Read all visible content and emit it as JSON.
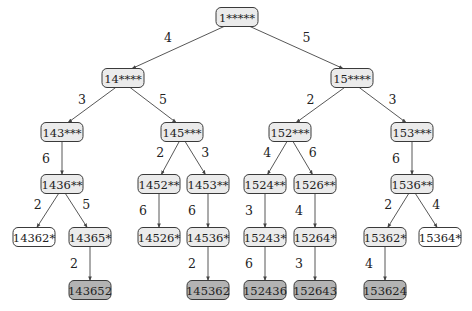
{
  "colors": {
    "internal_fill": "#ebebeb",
    "leaf_dead_fill": "#ffffff",
    "solution_fill": "#b3b3b3",
    "stroke": "#3a3a3a"
  },
  "nodes": [
    {
      "id": "n1",
      "label": "1*****",
      "kind": "internal"
    },
    {
      "id": "n14",
      "label": "14****",
      "kind": "internal"
    },
    {
      "id": "n15",
      "label": "15****",
      "kind": "internal"
    },
    {
      "id": "n143",
      "label": "143***",
      "kind": "internal"
    },
    {
      "id": "n145",
      "label": "145***",
      "kind": "internal"
    },
    {
      "id": "n152",
      "label": "152***",
      "kind": "internal"
    },
    {
      "id": "n153",
      "label": "153***",
      "kind": "internal"
    },
    {
      "id": "n1436",
      "label": "1436**",
      "kind": "internal"
    },
    {
      "id": "n1452",
      "label": "1452**",
      "kind": "internal"
    },
    {
      "id": "n1453",
      "label": "1453**",
      "kind": "internal"
    },
    {
      "id": "n1524",
      "label": "1524**",
      "kind": "internal"
    },
    {
      "id": "n1526",
      "label": "1526**",
      "kind": "internal"
    },
    {
      "id": "n1536",
      "label": "1536**",
      "kind": "internal"
    },
    {
      "id": "n14362",
      "label": "14362*",
      "kind": "dead"
    },
    {
      "id": "n14365",
      "label": "14365*",
      "kind": "internal"
    },
    {
      "id": "n14526",
      "label": "14526*",
      "kind": "internal"
    },
    {
      "id": "n14536",
      "label": "14536*",
      "kind": "internal"
    },
    {
      "id": "n15243",
      "label": "15243*",
      "kind": "internal"
    },
    {
      "id": "n15264",
      "label": "15264*",
      "kind": "internal"
    },
    {
      "id": "n15362",
      "label": "15362*",
      "kind": "internal"
    },
    {
      "id": "n15364",
      "label": "15364*",
      "kind": "dead"
    },
    {
      "id": "n143652",
      "label": "143652",
      "kind": "solution"
    },
    {
      "id": "n145362",
      "label": "145362",
      "kind": "solution"
    },
    {
      "id": "n152436",
      "label": "152436",
      "kind": "solution"
    },
    {
      "id": "n152643",
      "label": "152643",
      "kind": "solution"
    },
    {
      "id": "n153624",
      "label": "153624",
      "kind": "solution"
    }
  ],
  "edges": [
    {
      "from": "n1",
      "to": "n14",
      "label": "4"
    },
    {
      "from": "n1",
      "to": "n15",
      "label": "5"
    },
    {
      "from": "n14",
      "to": "n143",
      "label": "3"
    },
    {
      "from": "n14",
      "to": "n145",
      "label": "5"
    },
    {
      "from": "n15",
      "to": "n152",
      "label": "2"
    },
    {
      "from": "n15",
      "to": "n153",
      "label": "3"
    },
    {
      "from": "n143",
      "to": "n1436",
      "label": "6"
    },
    {
      "from": "n145",
      "to": "n1452",
      "label": "2"
    },
    {
      "from": "n145",
      "to": "n1453",
      "label": "3"
    },
    {
      "from": "n152",
      "to": "n1524",
      "label": "4"
    },
    {
      "from": "n152",
      "to": "n1526",
      "label": "6"
    },
    {
      "from": "n153",
      "to": "n1536",
      "label": "6"
    },
    {
      "from": "n1436",
      "to": "n14362",
      "label": "2"
    },
    {
      "from": "n1436",
      "to": "n14365",
      "label": "5"
    },
    {
      "from": "n1452",
      "to": "n14526",
      "label": "6"
    },
    {
      "from": "n1453",
      "to": "n14536",
      "label": "6"
    },
    {
      "from": "n1524",
      "to": "n15243",
      "label": "3"
    },
    {
      "from": "n1526",
      "to": "n15264",
      "label": "4"
    },
    {
      "from": "n1536",
      "to": "n15362",
      "label": "2"
    },
    {
      "from": "n1536",
      "to": "n15364",
      "label": "4"
    },
    {
      "from": "n14365",
      "to": "n143652",
      "label": "2"
    },
    {
      "from": "n14536",
      "to": "n145362",
      "label": "2"
    },
    {
      "from": "n15243",
      "to": "n152436",
      "label": "6"
    },
    {
      "from": "n15264",
      "to": "n152643",
      "label": "3"
    },
    {
      "from": "n15362",
      "to": "n153624",
      "label": "4"
    }
  ]
}
